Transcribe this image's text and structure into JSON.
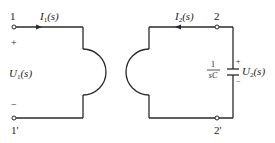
{
  "diagram": {
    "type": "coupled-coil circuit (s-domain)",
    "colors": {
      "line": "#2a2a2a",
      "background": "#ffffff"
    },
    "port1": {
      "terminal_top": "1",
      "terminal_bottom": "1'",
      "current_symbol": "I",
      "current_sub": "1",
      "current_arg": "(s)",
      "voltage_symbol": "U",
      "voltage_sub": "1",
      "voltage_arg": "(s)",
      "plus": "+",
      "minus": "−"
    },
    "port2": {
      "terminal_top": "2",
      "terminal_bottom": "2'",
      "current_symbol": "I",
      "current_sub": "2",
      "current_arg": "(s)",
      "voltage_symbol": "U",
      "voltage_sub": "2",
      "voltage_arg": "(s)",
      "plus": "+",
      "minus": "−"
    },
    "capacitor": {
      "impedance_numerator": "1",
      "impedance_denominator": "sC"
    }
  }
}
